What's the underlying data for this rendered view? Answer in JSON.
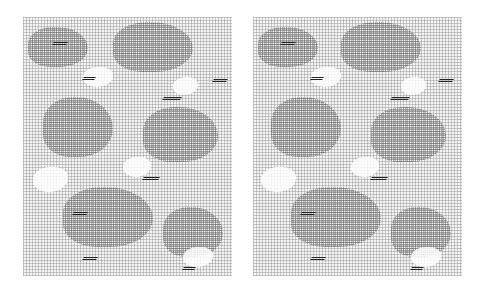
{
  "image": {
    "description": "Side-by-side pair of grayscale halftone dot-pattern textures (stereo pair)",
    "panels": [
      {
        "id": "left"
      },
      {
        "id": "right"
      }
    ],
    "colors": {
      "background": "#ffffff",
      "dot": "#787878",
      "dark": "#222222"
    }
  }
}
